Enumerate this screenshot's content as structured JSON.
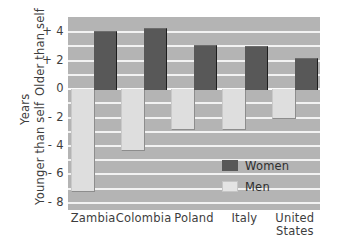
{
  "chart_data": {
    "type": "bar",
    "title": "",
    "subtitle": "",
    "xlabel": "",
    "ylabel": "Years",
    "ylabel_top": "Older than self",
    "ylabel_bottom": "Younger than self",
    "ylim": [
      -8,
      5
    ],
    "yticks": [
      4,
      2,
      0,
      -2,
      -4,
      -6,
      -8
    ],
    "ytick_labels": [
      "+ 4",
      "+ 2",
      "0",
      "- 2",
      "- 4",
      "- 6",
      "- 8"
    ],
    "grid": true,
    "legend_position": "inside-bottom-right",
    "categories": [
      "Zambia",
      "Colombia",
      "Poland",
      "Italy",
      "United States"
    ],
    "category_lines": [
      [
        "Zambia"
      ],
      [
        "Colombia"
      ],
      [
        "Poland"
      ],
      [
        "Italy"
      ],
      [
        "United",
        "States"
      ]
    ],
    "series": [
      {
        "name": "Women",
        "color": "#585858",
        "values": [
          4.1,
          4.3,
          3.1,
          3.05,
          2.2
        ]
      },
      {
        "name": "Men",
        "color": "#dedede",
        "values": [
          -7.2,
          -4.3,
          -2.8,
          -2.8,
          -2.0
        ]
      }
    ],
    "colors": {
      "plot_background": "#b4b4b4",
      "gridline": "#f2f2f2",
      "women": "#585858",
      "men": "#dedede",
      "text": "#3d3d3d"
    }
  },
  "legend": {
    "items": [
      {
        "label": "Women",
        "swatch": "women"
      },
      {
        "label": "Men",
        "swatch": "men"
      }
    ]
  }
}
